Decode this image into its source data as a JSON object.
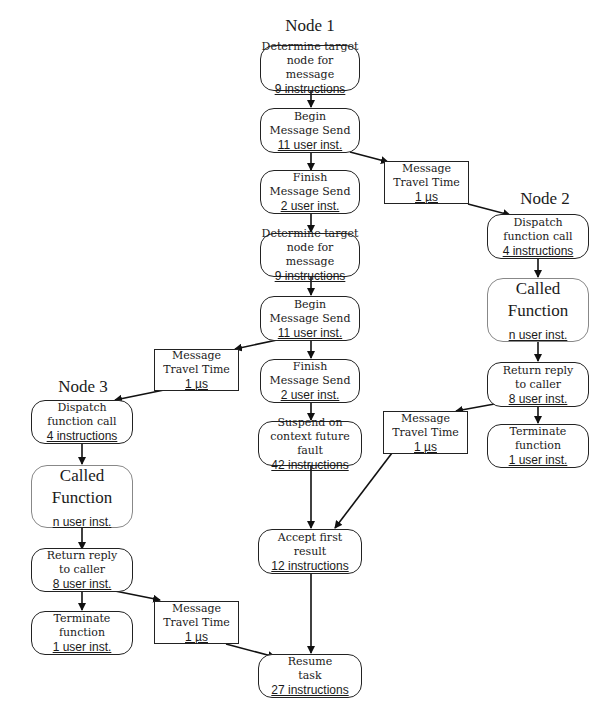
{
  "diagram": {
    "nodes": {
      "node1": "Node 1",
      "node2": "Node 2",
      "node3": "Node 3"
    },
    "boxes": {
      "n1_determine1": {
        "title1": "Determine target",
        "title2": "node for message",
        "cost": "9 instructions"
      },
      "n1_begin1": {
        "title1": "Begin",
        "title2": "Message Send",
        "cost": "11 user inst."
      },
      "n1_finish1": {
        "title1": "Finish",
        "title2": "Message Send",
        "cost": "2 user inst."
      },
      "n1_determine2": {
        "title1": "Determine target",
        "title2": "node for message",
        "cost": "9 instructions"
      },
      "n1_begin2": {
        "title1": "Begin",
        "title2": "Message Send",
        "cost": "11 user inst."
      },
      "n1_finish2": {
        "title1": "Finish",
        "title2": "Message Send",
        "cost": "2 user inst."
      },
      "n1_suspend": {
        "title1": "Suspend on",
        "title2": "context future fault",
        "cost": "42 instructions"
      },
      "n1_accept": {
        "title1": "Accept first",
        "title2": "result",
        "cost": "12 instructions"
      },
      "n1_resume": {
        "title1": "Resume",
        "title2": "task",
        "cost": "27 instructions"
      },
      "travel_1to2": {
        "title1": "Message",
        "title2": "Travel Time",
        "cost": "1 µs"
      },
      "travel_2to1": {
        "title1": "Message",
        "title2": "Travel Time",
        "cost": "1 µs"
      },
      "travel_1to3": {
        "title1": "Message",
        "title2": "Travel Time",
        "cost": "1 µs"
      },
      "travel_3to1": {
        "title1": "Message",
        "title2": "Travel Time",
        "cost": "1 µs"
      },
      "n2_dispatch": {
        "title1": "Dispatch",
        "title2": "function call",
        "cost": "4 instructions"
      },
      "n2_called": {
        "title1": "Called",
        "title2": "Function",
        "cost": "n user inst."
      },
      "n2_return": {
        "title1": "Return reply",
        "title2": "to caller",
        "cost": "8 user inst."
      },
      "n2_terminate": {
        "title1": "Terminate",
        "title2": "function",
        "cost": "1 user inst."
      },
      "n3_dispatch": {
        "title1": "Dispatch",
        "title2": "function call",
        "cost": "4 instructions"
      },
      "n3_called": {
        "title1": "Called",
        "title2": "Function",
        "cost": "n user inst."
      },
      "n3_return": {
        "title1": "Return reply",
        "title2": "to caller",
        "cost": "8 user inst."
      },
      "n3_terminate": {
        "title1": "Terminate",
        "title2": "function",
        "cost": "1 user inst."
      }
    }
  }
}
